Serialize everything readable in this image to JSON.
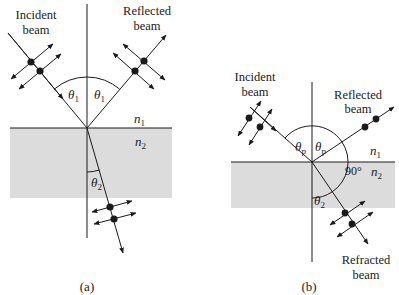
{
  "figure": {
    "panels": [
      {
        "id": "a",
        "caption": "(a)",
        "labels": {
          "incident_line1": "Incident",
          "incident_line2": "beam",
          "reflected_line1": "Reflected",
          "reflected_line2": "beam",
          "theta_incident": "θ",
          "theta_incident_sub": "1",
          "theta_reflected": "θ",
          "theta_reflected_sub": "1",
          "n1": "n",
          "n1_sub": "1",
          "n2": "n",
          "n2_sub": "2",
          "theta_refracted": "θ",
          "theta_refracted_sub": "2"
        }
      },
      {
        "id": "b",
        "caption": "(b)",
        "labels": {
          "incident_line1": "Incident",
          "incident_line2": "beam",
          "reflected_line1": "Reflected",
          "reflected_line2": "beam",
          "theta_incident": "θ",
          "theta_incident_sub": "p",
          "theta_reflected": "θ",
          "theta_reflected_sub": "p",
          "n1": "n",
          "n1_sub": "1",
          "n2": "n",
          "n2_sub": "2",
          "right_angle": "90°",
          "theta_refracted": "θ",
          "theta_refracted_sub": "2",
          "refracted_line1": "Refracted",
          "refracted_line2": "beam"
        }
      }
    ],
    "colors": {
      "medium2_fill": "#dcdcdc",
      "line": "#1a1a1a"
    }
  }
}
